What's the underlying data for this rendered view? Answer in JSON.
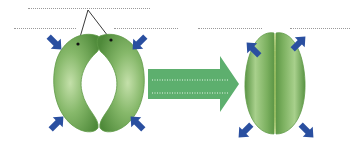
{
  "diagram": {
    "title": "",
    "colors": {
      "guard_cell_light": "#a9cf8c",
      "guard_cell_mid": "#7fb063",
      "guard_cell_dark": "#4f8a3a",
      "pressure_arrow": "#2a4fa0",
      "transition_arrow": "#5daf6e",
      "dotted_line": "#9a9a9a"
    },
    "left_panel": {
      "name": "open-stoma",
      "state_label": "",
      "pointer_label": "",
      "arrows_direction": "inward",
      "arrow_count": 4
    },
    "transition_arrow": {
      "label_line_1": "",
      "label_line_2": ""
    },
    "right_panel": {
      "name": "closed-stoma",
      "state_label": "",
      "arrows_direction": "outward",
      "arrow_count": 4
    },
    "blank_labels": [
      {
        "id": "top-pointer-label",
        "text": ""
      },
      {
        "id": "left-top-label",
        "text": ""
      },
      {
        "id": "left-right-top-label",
        "text": ""
      },
      {
        "id": "right-left-top-label",
        "text": ""
      },
      {
        "id": "right-right-top-label",
        "text": ""
      },
      {
        "id": "arrow-label-1",
        "text": ""
      },
      {
        "id": "arrow-label-2",
        "text": ""
      }
    ]
  }
}
